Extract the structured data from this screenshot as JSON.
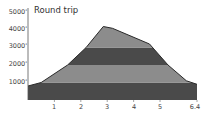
{
  "chart_data": {
    "type": "area",
    "title": "Round trip",
    "xlabel": "",
    "ylabel": "",
    "x_ticks": [
      "1",
      "2",
      "3",
      "4",
      "5",
      "6.4"
    ],
    "x_tick_values": [
      1,
      2,
      3,
      4,
      5,
      6.4
    ],
    "y_ticks": [
      "1000'",
      "2000'",
      "3000'",
      "4000'",
      "5000'"
    ],
    "y_tick_values": [
      1000,
      2000,
      3000,
      4000,
      5000
    ],
    "xlim": [
      0,
      6.4
    ],
    "ylim": [
      0,
      5000
    ],
    "grid": false,
    "legend": null,
    "series": [
      {
        "name": "Elevation",
        "x": [
          0,
          0.5,
          1.5,
          2.2,
          2.85,
          3.2,
          4.6,
          5.3,
          6.0,
          6.4
        ],
        "values": [
          800,
          1000,
          2000,
          3000,
          4200,
          4100,
          3200,
          2000,
          1100,
          900
        ]
      }
    ],
    "bands": [
      {
        "from": 0,
        "to": 1000,
        "color": "#4a4a4a"
      },
      {
        "from": 1000,
        "to": 2000,
        "color": "#8c8c8c"
      },
      {
        "from": 2000,
        "to": 3000,
        "color": "#4a4a4a"
      },
      {
        "from": 3000,
        "to": 5000,
        "color": "#8c8c8c"
      }
    ]
  },
  "labels": {
    "title": "Round trip",
    "y": [
      "5000'",
      "4000'",
      "3000'",
      "2000'",
      "1000'"
    ],
    "x": [
      "1",
      "2",
      "3",
      "4",
      "5",
      "6.4"
    ]
  }
}
